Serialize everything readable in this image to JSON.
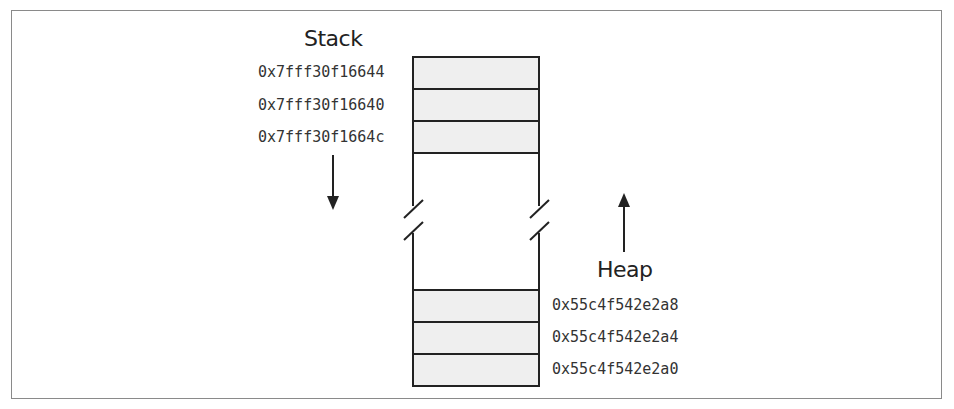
{
  "diagram": {
    "stack": {
      "label": "Stack",
      "direction": "grows downward",
      "addresses": [
        "0x7fff30f16644",
        "0x7fff30f16640",
        "0x7fff30f1664c"
      ]
    },
    "heap": {
      "label": "Heap",
      "direction": "grows upward",
      "addresses": [
        "0x55c4f542e2a8",
        "0x55c4f542e2a4",
        "0x55c4f542e2a0"
      ]
    },
    "colors": {
      "cell_fill": "#efefef",
      "stroke": "#222222",
      "frame": "#8a8a8a"
    }
  }
}
